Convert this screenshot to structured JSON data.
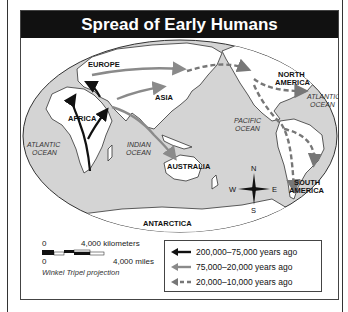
{
  "title": "Spread of Early Humans",
  "map": {
    "continents": {
      "europe": "EUROPE",
      "asia": "ASIA",
      "africa": "AFRICA",
      "australia": "AUSTRALIA",
      "north_america_1": "NORTH",
      "north_america_2": "AMERICA",
      "south_america_1": "SOUTH",
      "south_america_2": "AMERICA",
      "antarctica": "ANTARCTICA"
    },
    "oceans": {
      "atlantic_west_1": "ATLANTIC",
      "atlantic_west_2": "OCEAN",
      "indian_1": "INDIAN",
      "indian_2": "OCEAN",
      "pacific_1": "PACIFIC",
      "pacific_2": "OCEAN",
      "atlantic_east_1": "ATLANTIC",
      "atlantic_east_2": "OCEAN"
    },
    "compass": {
      "n": "N",
      "s": "S",
      "e": "E",
      "w": "W"
    },
    "colors": {
      "water": "#d4d4d4",
      "land": "#ffffff",
      "route1": "#111111",
      "route2": "#8a8a8a",
      "route3": "#777777"
    }
  },
  "scale": {
    "km_zero": "0",
    "km_label": "4,000 kilometers",
    "mi_zero": "0",
    "mi_label": "4,000 miles",
    "projection": "Winkel Tripel projection"
  },
  "legend": {
    "items": [
      {
        "label": "200,000–75,000 years ago",
        "style": "solid-black"
      },
      {
        "label": "75,000–20,000 years ago",
        "style": "solid-gray"
      },
      {
        "label": "20,000–10,000 years ago",
        "style": "dashed-gray"
      }
    ]
  }
}
